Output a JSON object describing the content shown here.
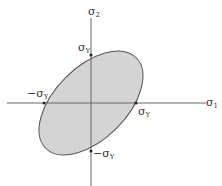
{
  "diagram": {
    "axes": {
      "x_label": "σ",
      "x_sub": "1",
      "y_label": "σ",
      "y_sub": "2"
    },
    "intercepts": {
      "top": {
        "label": "σ",
        "sub": "Y"
      },
      "bottom": {
        "label": "−σ",
        "sub": "Y"
      },
      "left": {
        "label": "−σ",
        "sub": "Y"
      },
      "right": {
        "label": "σ",
        "sub": "Y"
      }
    },
    "colors": {
      "fill": "#d4d4d4",
      "stroke": "#555555",
      "axis": "#666666"
    }
  }
}
